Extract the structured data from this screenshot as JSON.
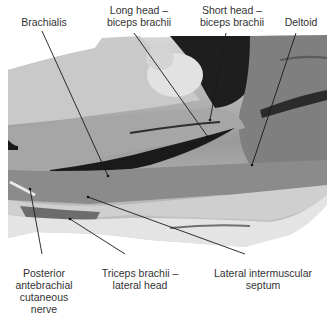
{
  "figure": {
    "labels": {
      "brachialis": "Brachialis",
      "long_head": "Long head –\nbiceps brachii",
      "short_head": "Short head –\nbiceps brachii",
      "deltoid": "Deltoid",
      "posterior_nerve": "Posterior\nantebrachial\ncutaneous\nnerve",
      "triceps_lateral": "Triceps brachii –\nlateral head",
      "lateral_septum": "Lateral intermuscular\nseptum"
    },
    "colors": {
      "background": "#ffffff",
      "leader_line": "#1a1a1a",
      "label_text": "#333333"
    }
  }
}
